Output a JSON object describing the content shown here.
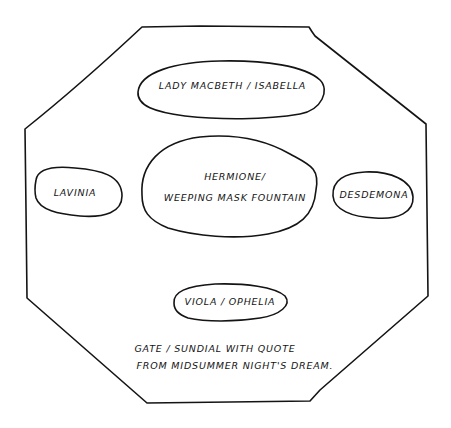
{
  "diagram": {
    "type": "garden-plan-sketch",
    "boundary": {
      "shape": "octagon",
      "label": "garden-boundary"
    },
    "areas": [
      {
        "id": "north",
        "label": "LADY MACBETH / ISABELLA"
      },
      {
        "id": "center",
        "label_lines": [
          "HERMIONE/",
          "WEEPING MASK FOUNTAIN"
        ]
      },
      {
        "id": "west",
        "label": "LAVINIA"
      },
      {
        "id": "east",
        "label": "DESDEMONA"
      },
      {
        "id": "south",
        "label": "VIOLA / OPHELIA"
      }
    ],
    "entrance_note": {
      "lines": [
        "GATE / SUNDIAL WITH QUOTE",
        "FROM MIDSUMMER NIGHT'S DREAM."
      ]
    }
  }
}
